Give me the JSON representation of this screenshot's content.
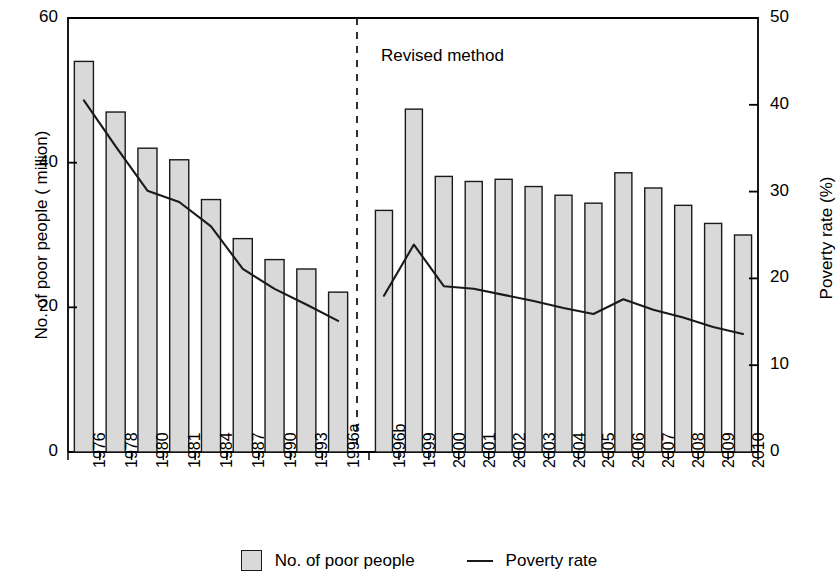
{
  "chart_data": {
    "type": "bar",
    "title": "",
    "xlabel": "",
    "ylabel": "No. of poor people ( million)",
    "ylabel_right": "Poverty rate (%)",
    "ylim": [
      0,
      60
    ],
    "ylim_right": [
      0,
      50
    ],
    "grid": false,
    "legend_position": "bottom-center",
    "annotation": "Revised method",
    "annotation_divider": "dashed vertical line between 1996a and 1996b",
    "categories": [
      "1976",
      "1978",
      "1980",
      "1981",
      "1984",
      "1987",
      "1990",
      "1993",
      "1996a",
      "1996b",
      "1999",
      "2000",
      "2001",
      "2002",
      "2003",
      "2004",
      "2005",
      "2006",
      "2007",
      "2008",
      "2009",
      "2010"
    ],
    "series": [
      {
        "name": "No. of poor people",
        "type": "bar",
        "axis": "left",
        "unit": "million",
        "values": [
          54.0,
          47.0,
          42.0,
          40.4,
          34.9,
          29.5,
          26.6,
          25.3,
          22.1,
          33.4,
          47.4,
          38.1,
          37.4,
          37.7,
          36.7,
          35.5,
          34.4,
          38.6,
          36.5,
          34.1,
          31.6,
          30.0
        ]
      },
      {
        "name": "Poverty rate",
        "type": "line",
        "axis": "right",
        "unit": "%",
        "values": [
          40.5,
          35.2,
          30.1,
          28.8,
          26.0,
          21.1,
          18.8,
          17.0,
          15.1,
          18.0,
          23.9,
          19.1,
          18.8,
          18.1,
          17.4,
          16.6,
          15.9,
          17.6,
          16.4,
          15.5,
          14.4,
          13.6
        ]
      }
    ],
    "yticks_left": [
      "0",
      "20",
      "40",
      "60"
    ],
    "yticks_right": [
      "0",
      "10",
      "20",
      "30",
      "40",
      "50"
    ],
    "legend": [
      {
        "label": "No. of poor people",
        "marker": "bar-swatch-icon"
      },
      {
        "label": "Poverty rate",
        "marker": "line-swatch-icon"
      }
    ],
    "colors": {
      "bar_fill": "#d9d9d9",
      "bar_stroke": "#1a1a1a",
      "line": "#1a1a1a",
      "axis": "#000000"
    }
  }
}
